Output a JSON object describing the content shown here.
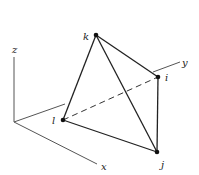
{
  "axes": {
    "x_label": "x",
    "y_label": "y",
    "z_label": "z"
  },
  "nodes": {
    "i": "i",
    "j": "j",
    "k": "k",
    "l": "l"
  },
  "colors": {
    "axis": "#555555",
    "edge": "#222222",
    "node": "#111111"
  }
}
